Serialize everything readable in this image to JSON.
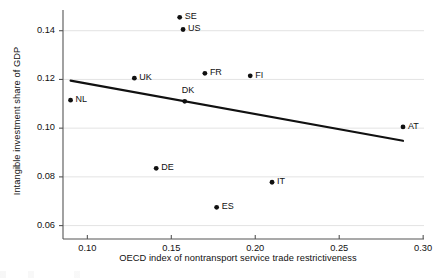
{
  "chart_data": {
    "type": "scatter",
    "title": "",
    "xlabel": "OECD index of nontransport service trade restrictiveness",
    "ylabel": "Intangible investment share of GDP",
    "xlim": [
      0.0855,
      0.3005
    ],
    "ylim": [
      0.0545,
      0.1485
    ],
    "xticks": [
      0.1,
      0.15,
      0.2,
      0.25,
      0.3
    ],
    "xtick_labels": [
      "0.10",
      "0.15",
      "0.20",
      "0.25",
      "0.30"
    ],
    "yticks": [
      0.06,
      0.08,
      0.1,
      0.12,
      0.14
    ],
    "ytick_labels": [
      "0.06",
      "0.08",
      "0.10",
      "0.12",
      "0.14"
    ],
    "grid": "horizontal",
    "legend": "none",
    "point_color": "#111111",
    "line_color": "#111111",
    "grid_color": "#e3e3e3",
    "axis_color": "#555555",
    "points": [
      {
        "label": "NL",
        "x": 0.09,
        "y": 0.1115,
        "label_side": "right"
      },
      {
        "label": "UK",
        "x": 0.128,
        "y": 0.1205,
        "label_side": "right"
      },
      {
        "label": "DE",
        "x": 0.141,
        "y": 0.0835,
        "label_side": "right"
      },
      {
        "label": "SE",
        "x": 0.155,
        "y": 0.1455,
        "label_side": "right"
      },
      {
        "label": "US",
        "x": 0.157,
        "y": 0.1405,
        "label_side": "right"
      },
      {
        "label": "DK",
        "x": 0.158,
        "y": 0.111,
        "label_side": "above"
      },
      {
        "label": "FR",
        "x": 0.17,
        "y": 0.1225,
        "label_side": "right"
      },
      {
        "label": "ES",
        "x": 0.177,
        "y": 0.0675,
        "label_side": "right"
      },
      {
        "label": "FI",
        "x": 0.197,
        "y": 0.1215,
        "label_side": "right"
      },
      {
        "label": "IT",
        "x": 0.21,
        "y": 0.0778,
        "label_side": "right"
      },
      {
        "label": "AT",
        "x": 0.288,
        "y": 0.1005,
        "label_side": "right"
      }
    ],
    "trendline": {
      "name": "fitted regression line",
      "x": [
        0.09,
        0.288
      ],
      "y": [
        0.1195,
        0.0948
      ]
    }
  }
}
